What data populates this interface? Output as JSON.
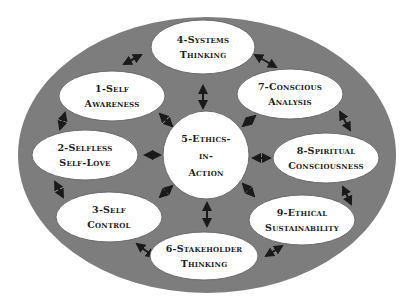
{
  "diagram": {
    "colors": {
      "background": "#ffffff",
      "outer_ring": "#7d7d7d",
      "node_fill": "#ffffff",
      "node_stroke": "#6a6a6a",
      "arrow": "#1a1a1a",
      "text": "#1e1e1e"
    },
    "center_node": {
      "id": "5",
      "lines": [
        "5-Ethics-",
        "in-",
        "Action"
      ]
    },
    "nodes": [
      {
        "id": "1",
        "lines": [
          "1-Self",
          "Awareness"
        ]
      },
      {
        "id": "2",
        "lines": [
          "2-Selfless",
          "Self-Love"
        ]
      },
      {
        "id": "3",
        "lines": [
          "3-Self",
          "Control"
        ]
      },
      {
        "id": "4",
        "lines": [
          "4-Systems",
          "Thinking"
        ]
      },
      {
        "id": "6",
        "lines": [
          "6-Stakeholder",
          "Thinking"
        ]
      },
      {
        "id": "7",
        "lines": [
          "7-Conscious",
          "Analysis"
        ]
      },
      {
        "id": "8",
        "lines": [
          "8-Spiritual",
          "Consciousness"
        ]
      },
      {
        "id": "9",
        "lines": [
          "9-Ethical",
          "Sustainability"
        ]
      }
    ],
    "connections": [
      [
        "1",
        "4"
      ],
      [
        "4",
        "7"
      ],
      [
        "7",
        "8"
      ],
      [
        "8",
        "9"
      ],
      [
        "9",
        "6"
      ],
      [
        "6",
        "3"
      ],
      [
        "3",
        "2"
      ],
      [
        "2",
        "1"
      ],
      [
        "5",
        "1"
      ],
      [
        "5",
        "2"
      ],
      [
        "5",
        "3"
      ],
      [
        "5",
        "4"
      ],
      [
        "5",
        "6"
      ],
      [
        "5",
        "7"
      ],
      [
        "5",
        "8"
      ],
      [
        "5",
        "9"
      ]
    ],
    "arrow_style": "bidirectional"
  }
}
